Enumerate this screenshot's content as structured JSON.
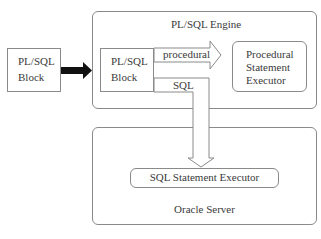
{
  "diagram": {
    "external_block": {
      "label_line1": "PL/SQL",
      "label_line2": "Block"
    },
    "engine": {
      "title": "PL/SQL Engine",
      "inner_block": {
        "label_line1": "PL/SQL",
        "label_line2": "Block"
      },
      "procedural_arrow_label": "procedural",
      "sql_arrow_label": "SQL",
      "procedural_executor": {
        "line1": "Procedural",
        "line2": "Statement",
        "line3": "Executor"
      }
    },
    "server": {
      "title": "Oracle Server",
      "sql_executor": {
        "label": "SQL Statement Executor"
      }
    },
    "colors": {
      "border": "#8a8a8a",
      "text": "#3a3a3a",
      "thick_arrow": "#111111"
    }
  }
}
